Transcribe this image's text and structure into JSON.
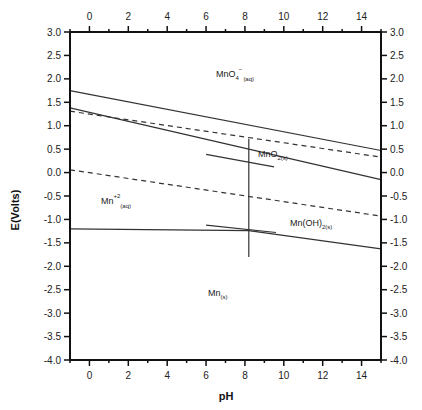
{
  "chart_data": {
    "type": "line",
    "title": "",
    "xlabel": "pH",
    "ylabel": "E(Volts)",
    "xlim": [
      -1,
      15
    ],
    "ylim": [
      -4.0,
      3.0
    ],
    "grid": false,
    "legend": null,
    "x_ticks": [
      0,
      2,
      4,
      6,
      8,
      10,
      12,
      14
    ],
    "x_tick_labels": [
      "0",
      "2",
      "4",
      "6",
      "8",
      "10",
      "12",
      "14"
    ],
    "y_ticks": [
      3.0,
      2.5,
      2.0,
      1.5,
      1.0,
      0.5,
      0.0,
      -0.5,
      -1.0,
      -1.5,
      -2.0,
      -2.5,
      -3.0,
      -3.5,
      -4.0
    ],
    "y_tick_labels": [
      "3.0",
      "2.5",
      "2.0",
      "1.5",
      "1.0",
      "0.5",
      "0.0",
      "-0.5",
      "-1.0",
      "-1.5",
      "-2.0",
      "-2.5",
      "-3.0",
      "-3.5",
      "-4.0"
    ],
    "series": [
      {
        "name": "O2/H2O upper boundary",
        "style": "solid",
        "x": [
          -1,
          15
        ],
        "y": [
          1.75,
          0.47
        ]
      },
      {
        "name": "water oxidation (dashed)",
        "style": "dashed",
        "x": [
          -1,
          15
        ],
        "y": [
          1.31,
          0.33
        ]
      },
      {
        "name": "MnO4-/MnO2 boundary",
        "style": "solid",
        "x": [
          -1,
          15
        ],
        "y": [
          1.38,
          -0.15
        ]
      },
      {
        "name": "water reduction (dashed)",
        "style": "dashed",
        "x": [
          -1,
          15
        ],
        "y": [
          0.06,
          -0.93
        ]
      },
      {
        "name": "Mn+2/Mn boundary",
        "style": "solid",
        "x": [
          -1,
          8.2
        ],
        "y": [
          -1.2,
          -1.24
        ]
      },
      {
        "name": "Mn(OH)2/Mn boundary",
        "style": "solid",
        "x": [
          8.2,
          15
        ],
        "y": [
          -1.24,
          -1.63
        ]
      },
      {
        "name": "Mn+2/MnO2 & Mn(OH)2 vertical boundary",
        "style": "solid",
        "x": [
          8.2,
          8.2
        ],
        "y": [
          0.72,
          -1.8
        ]
      },
      {
        "name": "short segment near MnO2",
        "style": "solid",
        "x": [
          6.0,
          9.5
        ],
        "y": [
          0.39,
          0.12
        ]
      },
      {
        "name": "short segment near Mn(OH)2",
        "style": "solid",
        "x": [
          6.0,
          9.6
        ],
        "y": [
          -1.12,
          -1.28
        ]
      }
    ],
    "annotations": [
      {
        "text": "MnO4",
        "sup": "-",
        "sub": "(aq)",
        "x": 8.0,
        "y": 2.05
      },
      {
        "text": "MnO2",
        "sub": "(s)",
        "x": 8.6,
        "y": 0.35
      },
      {
        "text": "Mn",
        "sup": "+2",
        "sub": "(aq)",
        "x": 0.6,
        "y": -0.65
      },
      {
        "text": "Mn(OH)2",
        "sub": "(s)",
        "x": 10.3,
        "y": -1.05
      },
      {
        "text": "Mn",
        "sub": "(s)",
        "x": 7.3,
        "y": -2.7
      }
    ]
  },
  "labels": {
    "xlabel": "pH",
    "ylabel": "E(Volts)",
    "mno4_main": "MnO",
    "mno4_sub1": "4",
    "mno4_sup": "−",
    "mno4_sub2": "(aq)",
    "mno2_main": "MnO",
    "mno2_sub": "2(s)",
    "mn2_main": "Mn",
    "mn2_sup": "+2",
    "mn2_sub": "(aq)",
    "mnoh2_main": "Mn(OH)",
    "mnoh2_sub": "2(s)",
    "mn_main": "Mn",
    "mn_sub": "(s)"
  }
}
